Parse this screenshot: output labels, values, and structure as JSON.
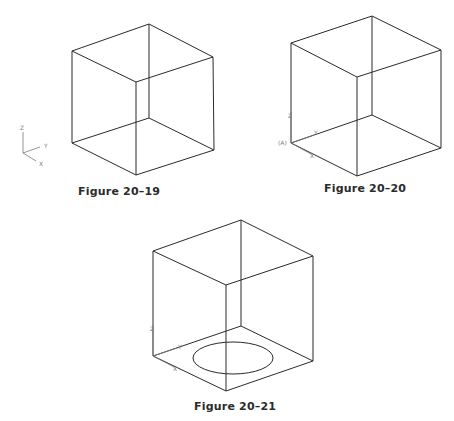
{
  "figures": [
    {
      "id": "fig-20-19",
      "caption": "Figure 20–19",
      "cube": {
        "top": [
          [
            149,
            24
          ],
          [
            72,
            51
          ],
          [
            136,
            82
          ],
          [
            213,
            57
          ]
        ],
        "bottom": [
          [
            149,
            118
          ],
          [
            72,
            143
          ],
          [
            136,
            175
          ],
          [
            214,
            150
          ]
        ]
      },
      "ucs_icon": {
        "origin": [
          18,
          153
        ],
        "labels": {
          "z": "Z",
          "y": "Y",
          "x": "X"
        }
      }
    },
    {
      "id": "fig-20-20",
      "caption": "Figure 20–20",
      "cube": {
        "top": [
          [
            372,
            16
          ],
          [
            291,
            43
          ],
          [
            357,
            77
          ],
          [
            441,
            50
          ]
        ],
        "bottom": [
          [
            372,
            115
          ],
          [
            291,
            143
          ],
          [
            357,
            176
          ],
          [
            441,
            148
          ]
        ]
      },
      "ucs_icon": {
        "origin": [
          291,
          143
        ],
        "labels": {
          "z": "Z",
          "y": "Y",
          "x": "X"
        },
        "point_label": "(A)"
      }
    },
    {
      "id": "fig-20-21",
      "caption": "Figure 20–21",
      "cube": {
        "top": [
          [
            241,
            220
          ],
          [
            153,
            251
          ],
          [
            226,
            285
          ],
          [
            313,
            256
          ]
        ],
        "bottom": [
          [
            241,
            326
          ],
          [
            153,
            356
          ],
          [
            226,
            391
          ],
          [
            313,
            361
          ]
        ]
      },
      "circle_on_base": {
        "cx": 233,
        "cy": 358,
        "rx": 40,
        "ry": 16
      },
      "ucs_icon": {
        "origin": [
          153,
          356
        ],
        "labels": {
          "z": "Z",
          "y": "Y",
          "x": "X"
        }
      }
    }
  ]
}
